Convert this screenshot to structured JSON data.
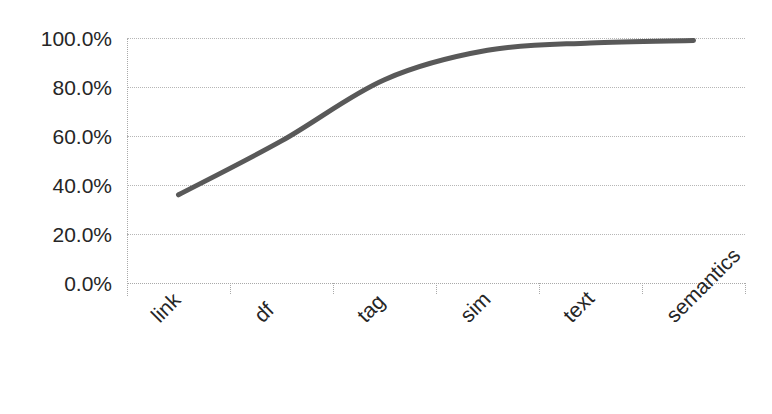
{
  "chart_data": {
    "type": "line",
    "title": "",
    "xlabel": "",
    "ylabel": "",
    "categories": [
      "link",
      "df",
      "tag",
      "sim",
      "text",
      "semantics"
    ],
    "series": [
      {
        "name": "cumulative",
        "values": [
          36.0,
          58.0,
          83.0,
          95.0,
          98.0,
          99.0
        ]
      }
    ],
    "ylim": [
      0,
      100
    ],
    "ytick_values": [
      0,
      20,
      40,
      60,
      80,
      100
    ],
    "ytick_labels": [
      "0.0%",
      "20.0%",
      "40.0%",
      "60.0%",
      "80.0%",
      "100.0%"
    ],
    "grid": true,
    "grid_style": "dotted",
    "legend": "none",
    "line_color": "#595959",
    "line_width": 5,
    "markers": "none",
    "xlabel_rotation": -45
  },
  "axes": {
    "y_axis_name": "y-axis",
    "x_axis_name": "x-axis"
  }
}
